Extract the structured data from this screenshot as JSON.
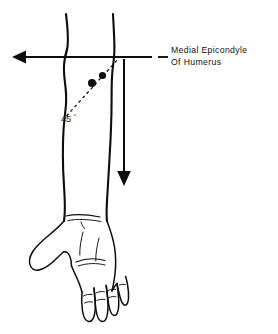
{
  "figure": {
    "title_visible": false,
    "background_color": "#ffffff",
    "ink_color": "#0d0d0d"
  },
  "annotations": {
    "callout": {
      "line1": "Medial Epicondyle",
      "line2": "Of Humerus",
      "leader_dash_label": "leader-dash"
    },
    "angle": {
      "value": "45",
      "degree_symbol": "°"
    }
  },
  "markers": [
    {
      "name": "injection-point-distal",
      "cx": 92,
      "cy": 83,
      "r": 4.0
    },
    {
      "name": "injection-point-proximal",
      "cx": 102.5,
      "cy": 75.5,
      "r": 3.6
    }
  ],
  "axes": {
    "horizontal": {
      "name": "horizontal-reference-axis",
      "y": 57,
      "x_start": 152,
      "x_end": 16,
      "arrow_direction": "left"
    },
    "vertical": {
      "name": "vertical-reference-axis",
      "x": 124,
      "y_start": 59,
      "y_end": 180,
      "arrow_direction": "down"
    }
  }
}
